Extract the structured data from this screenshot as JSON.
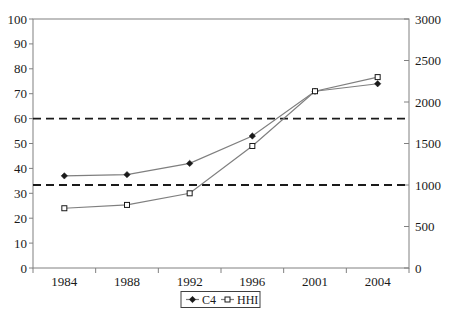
{
  "chart_data": {
    "type": "line",
    "title": "",
    "categories": [
      "1984",
      "1988",
      "1992",
      "1996",
      "2001",
      "2004"
    ],
    "series": [
      {
        "name": "C4",
        "axis": "left",
        "marker": "filled-diamond",
        "values": [
          37,
          37.5,
          42,
          53,
          71,
          74
        ]
      },
      {
        "name": "HHI",
        "axis": "right",
        "marker": "open-square",
        "values": [
          720,
          760,
          900,
          1470,
          2130,
          2300
        ]
      }
    ],
    "left_axis": {
      "min": 0,
      "max": 100,
      "step": 10,
      "tick_labels": [
        "0",
        "10",
        "20",
        "30",
        "40",
        "50",
        "60",
        "70",
        "80",
        "90",
        "100"
      ]
    },
    "right_axis": {
      "min": 0,
      "max": 3000,
      "step": 500,
      "tick_labels": [
        "0",
        "500",
        "1000",
        "1500",
        "2000",
        "2500",
        "3000"
      ]
    },
    "reference_lines": [
      {
        "axis": "right",
        "value": 1000,
        "style": "dashed"
      },
      {
        "axis": "right",
        "value": 1800,
        "style": "dashed"
      }
    ],
    "legend": {
      "position": "bottom-center",
      "entries": [
        "C4",
        "HHI"
      ]
    },
    "grid": "off",
    "colors": {
      "background": "#ffffff",
      "axis_line": "#808080",
      "text": "#1a1a1a",
      "series_line": "#7f7f7f",
      "marker": "#1a1a1a",
      "marker_fill_open": "#ffffff",
      "reference_line": "#1a1a1a",
      "legend_border": "#404040"
    }
  }
}
